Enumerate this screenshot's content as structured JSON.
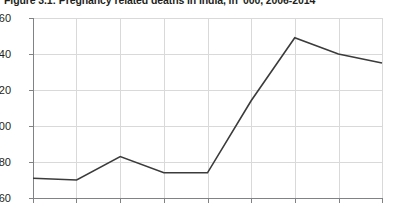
{
  "chart_data": {
    "type": "line",
    "title": "Figure 3.1: Pregnancy related deaths in India, in '000, 2006-2014",
    "subtitle": "",
    "xlabel": "",
    "ylabel": "",
    "x": [
      2006,
      2007,
      2008,
      2009,
      2010,
      2011,
      2012,
      2013,
      2014
    ],
    "categories": [
      "2006",
      "2007",
      "2008",
      "2009",
      "2010",
      "2011",
      "2012",
      "2013",
      "2014"
    ],
    "series": [
      {
        "name": "Pregnancy related deaths",
        "values": [
          71,
          70,
          83,
          74,
          74,
          114,
          149,
          140,
          135
        ],
        "color": "#3b3b3b"
      }
    ],
    "values": [
      71,
      70,
      83,
      74,
      74,
      114,
      149,
      140,
      135
    ],
    "ylim": [
      60,
      160
    ],
    "yticks": [
      60,
      80,
      100,
      120,
      140,
      160
    ],
    "ytick_labels": [
      "60",
      "80",
      "100",
      "120",
      "140",
      "160"
    ],
    "xlim": [
      2006,
      2014
    ],
    "xticks": [
      2006,
      2007,
      2008,
      2009,
      2010,
      2011,
      2012,
      2013,
      2014
    ],
    "xtick_labels": [
      "2006",
      "2007",
      "2008",
      "2009",
      "2010",
      "2011",
      "2012",
      "2013",
      "2014"
    ],
    "grid": true,
    "grid_color": "#d9d9d9",
    "axis_color": "#808285",
    "legend": false,
    "legend_position": "none",
    "markers": false,
    "line_width": 1.6,
    "background": "#ffffff"
  }
}
